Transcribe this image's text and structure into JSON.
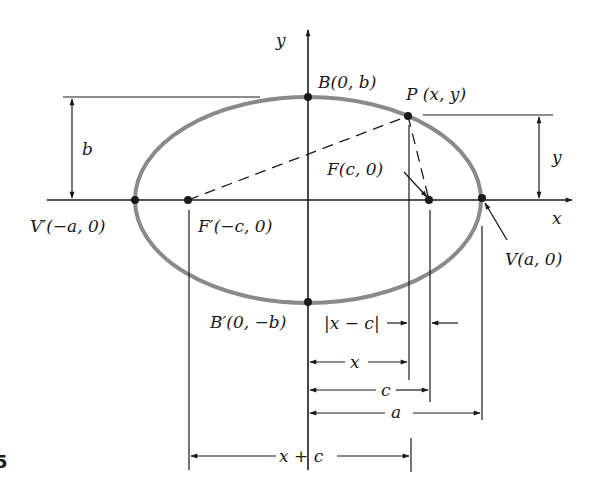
{
  "figure": {
    "number_fragment": "5"
  },
  "axes": {
    "x_label": "x",
    "y_label": "y"
  },
  "points": {
    "B": "B(0, b)",
    "B_prime": "B′(0, −b)",
    "P": "P (x, y)",
    "F": "F(c, 0)",
    "F_prime": "F′(−c, 0)",
    "V": "V(a, 0)",
    "V_prime": "V′(−a, 0)"
  },
  "dimensions": {
    "semi_minor": "b",
    "y_height": "y",
    "abs_x_minus_c": "|x − c|",
    "x_width": "x",
    "c_width": "c",
    "a_width": "a",
    "x_plus_c": "x + c"
  },
  "colors": {
    "ellipse": "#8a8a8a",
    "lines": "#1a1a1a",
    "background": "#ffffff"
  }
}
